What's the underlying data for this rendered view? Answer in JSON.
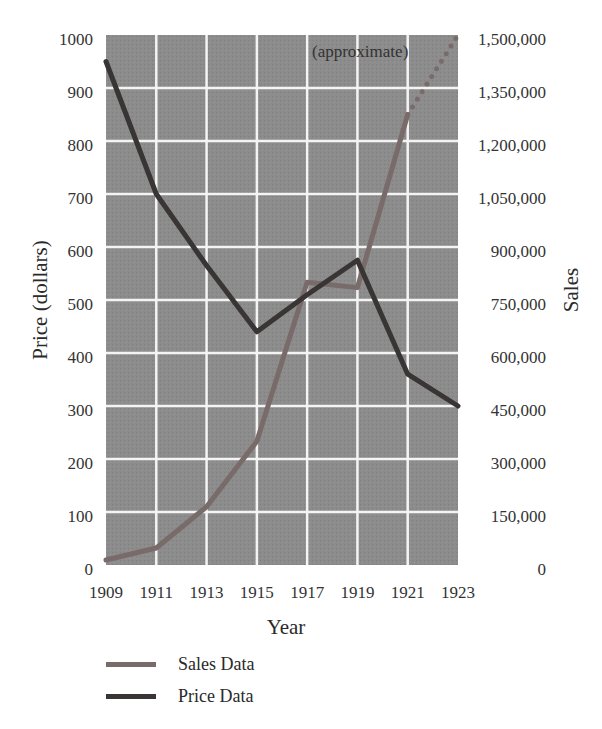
{
  "chart_data": {
    "type": "line",
    "title": "",
    "xlabel": "Year",
    "ylabel": "Price (dollars)",
    "y2label": "Sales",
    "x": [
      1909,
      1911,
      1913,
      1915,
      1917,
      1919,
      1921,
      1923
    ],
    "x_ticks": [
      "1909",
      "1911",
      "1913",
      "1915",
      "1917",
      "1919",
      "1921",
      "1923"
    ],
    "ylim": [
      0,
      1000
    ],
    "y_ticks": [
      "0",
      "100",
      "200",
      "300",
      "400",
      "500",
      "600",
      "700",
      "800",
      "900",
      "1000"
    ],
    "y2lim": [
      0,
      1500000
    ],
    "y2_ticks": [
      "0",
      "150,000",
      "300,000",
      "450,000",
      "600,000",
      "750,000",
      "900,000",
      "1,050,000",
      "1,200,000",
      "1,350,000",
      "1,500,000"
    ],
    "grid": true,
    "legend_position": "bottom-left",
    "series": [
      {
        "name": "Sales Data",
        "axis": "right",
        "color": "#7a6b6b",
        "x": [
          1909,
          1911,
          1913,
          1915,
          1917,
          1919,
          1921
        ],
        "values": [
          14000,
          48000,
          165000,
          350000,
          800000,
          785000,
          1275000
        ],
        "projected": {
          "x": [
            1921,
            1923
          ],
          "values": [
            1275000,
            1500000
          ],
          "style": "dotted",
          "annotation": "(approximate)"
        }
      },
      {
        "name": "Price Data",
        "axis": "left",
        "color": "#3a3535",
        "x": [
          1909,
          1911,
          1913,
          1915,
          1917,
          1919,
          1921,
          1923
        ],
        "values": [
          950,
          700,
          565,
          440,
          510,
          575,
          360,
          300
        ]
      }
    ],
    "annotations": [
      {
        "text": "(approximate)",
        "near": "Sales Data 1921-1923"
      }
    ]
  },
  "legend": {
    "items": [
      {
        "label": "Sales Data",
        "color": "#7a6b6b"
      },
      {
        "label": "Price Data",
        "color": "#3a3535"
      }
    ]
  }
}
